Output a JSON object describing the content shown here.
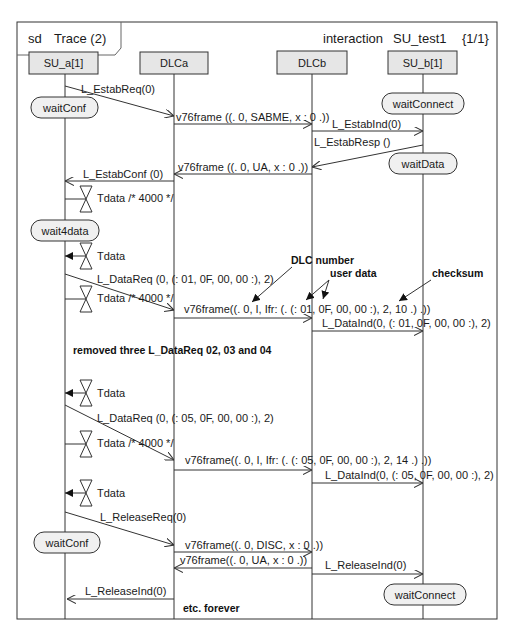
{
  "frame": {
    "kind": "sd",
    "name": "Trace (2)",
    "interaction_label": "interaction",
    "interaction_name": "SU_test1",
    "page": "{1/1}"
  },
  "lifelines": [
    {
      "id": "su_a",
      "label": "SU_a[1]"
    },
    {
      "id": "dlca",
      "label": "DLCa"
    },
    {
      "id": "dlcb",
      "label": "DLCb"
    },
    {
      "id": "su_b",
      "label": "SU_b[1]"
    }
  ],
  "states": [
    {
      "lifeline": "su_a",
      "label": "waitConf"
    },
    {
      "lifeline": "su_b",
      "label": "waitConnect"
    },
    {
      "lifeline": "su_b",
      "label": "waitData"
    },
    {
      "lifeline": "su_a",
      "label": "wait4data"
    },
    {
      "lifeline": "su_a",
      "label": "waitConf"
    },
    {
      "lifeline": "su_b",
      "label": "waitConnect"
    }
  ],
  "messages": [
    {
      "from": "su_a",
      "to": "dlca",
      "label": "L_EstabReq(0)"
    },
    {
      "from": "dlca",
      "to": "dlcb",
      "label": "v76frame ((. 0, SABME, x : 0 .))"
    },
    {
      "from": "dlcb",
      "to": "su_b",
      "label": "L_EstabInd(0)"
    },
    {
      "from": "su_b",
      "to": "dlcb",
      "label": "L_EstabResp ()"
    },
    {
      "from": "dlcb",
      "to": "dlca",
      "label": "v76frame ((. 0, UA, x : 0 .))"
    },
    {
      "from": "dlca",
      "to": "su_a",
      "label": "L_EstabConf (0)"
    },
    {
      "from": "su_a",
      "to": "dlca",
      "label": "L_DataReq (0, (: 01, 0F, 00, 00 :), 2)"
    },
    {
      "from": "dlca",
      "to": "dlcb",
      "label": "v76frame((. 0, I, Ifr: (. (: 01, 0F, 00, 00 :), 2, 10 .) .))"
    },
    {
      "from": "dlcb",
      "to": "su_b",
      "label": "L_DataInd(0, (: 01, 0F, 00, 00 :), 2)"
    },
    {
      "from": "su_a",
      "to": "dlca",
      "label": "L_DataReq (0, (: 05, 0F, 00, 00 :), 2)"
    },
    {
      "from": "dlca",
      "to": "dlcb",
      "label": "v76frame((. 0, I, Ifr: (. (: 05, 0F, 00, 00 :), 2, 14 .) .))"
    },
    {
      "from": "dlcb",
      "to": "su_b",
      "label": "L_DataInd(0, (: 05, 0F, 00, 00 :), 2)"
    },
    {
      "from": "su_a",
      "to": "dlca",
      "label": "L_ReleaseReq(0)"
    },
    {
      "from": "dlca",
      "to": "dlcb",
      "label": "v76frame((. 0, DISC, x : 0 .))"
    },
    {
      "from": "dlcb",
      "to": "dlca",
      "label": "v76frame((. 0, UA, x : 0 .))"
    },
    {
      "from": "dlcb",
      "to": "su_b",
      "label": "L_ReleaseInd(0)"
    },
    {
      "from": "dlca",
      "to": "su_a",
      "label": "L_ReleaseInd(0)"
    }
  ],
  "timers": [
    {
      "action": "set",
      "label": "Tdata /* 4000 */"
    },
    {
      "action": "timeout",
      "label": "Tdata"
    },
    {
      "action": "set",
      "label": "Tdata /* 4000 */"
    },
    {
      "action": "timeout",
      "label": "Tdata"
    },
    {
      "action": "set",
      "label": "Tdata /* 4000 */"
    },
    {
      "action": "timeout",
      "label": "Tdata"
    }
  ],
  "annotations": {
    "dlc_number": "DLC number",
    "user_data": "user data",
    "checksum": "checksum",
    "removed_note": "removed three L_DataReq 02, 03 and 04",
    "etc_note": "etc. forever"
  }
}
